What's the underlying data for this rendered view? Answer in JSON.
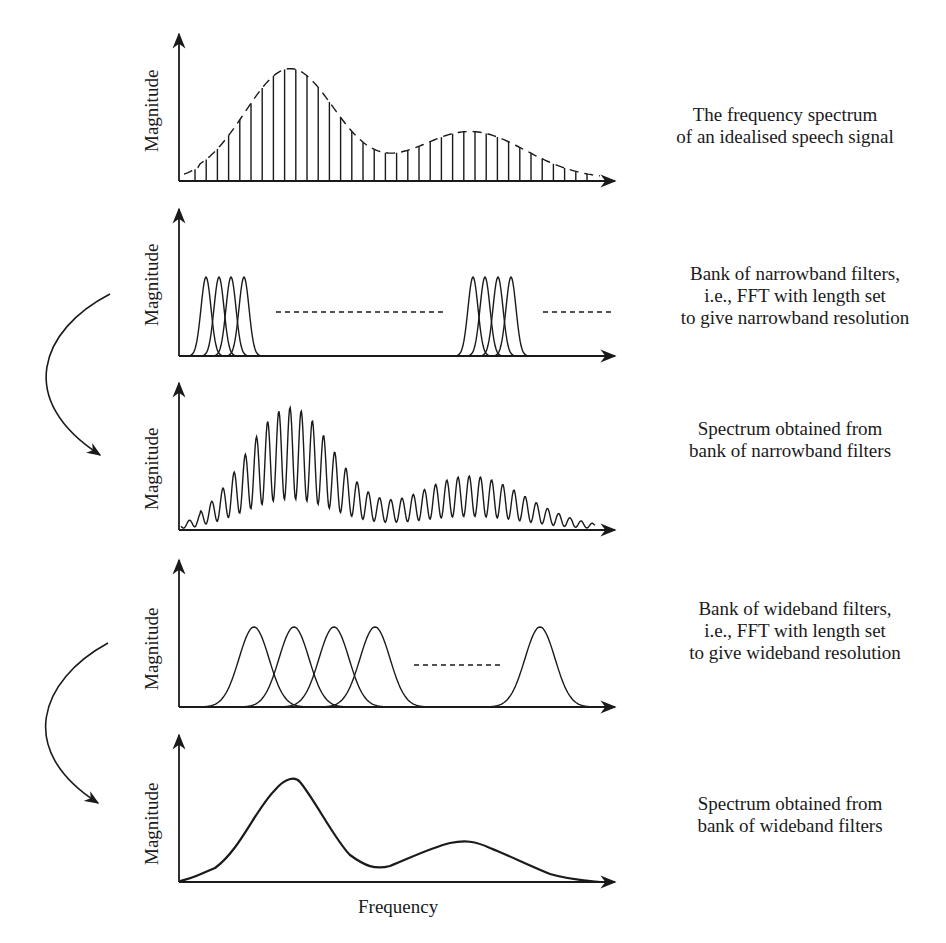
{
  "panels": [
    {
      "id": "speech-spectrum",
      "y_label": "Magnitude",
      "caption": [
        "The frequency spectrum",
        "of an idealised speech signal"
      ]
    },
    {
      "id": "narrowband-filters",
      "y_label": "Magnitude",
      "caption": [
        "Bank of  narrowband filters,",
        "i.e., FFT with length set",
        "to give narrowband resolution"
      ]
    },
    {
      "id": "narrowband-spectrum",
      "y_label": "Magnitude",
      "caption": [
        "Spectrum obtained from",
        "bank of narrowband filters"
      ]
    },
    {
      "id": "wideband-filters",
      "y_label": "Magnitude",
      "caption": [
        "Bank of  wideband filters,",
        "i.e., FFT with length set",
        "to give wideband resolution"
      ]
    },
    {
      "id": "wideband-spectrum",
      "y_label": "Magnitude",
      "caption": [
        "Spectrum obtained from",
        "bank of  wideband filters"
      ]
    }
  ],
  "x_label": "Frequency",
  "colors": {
    "ink": "#1a1a1a",
    "background": "#ffffff"
  }
}
